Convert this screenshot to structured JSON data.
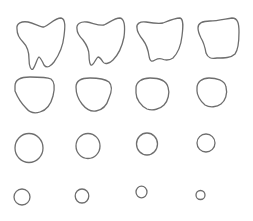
{
  "figure": {
    "background": "#ffffff",
    "stroke_color": "#6e6e6e",
    "stroke_width": 1.3,
    "rows": 4,
    "cols": 4
  },
  "shapes": [
    {
      "row": 1,
      "col": 1,
      "kind": "tooth",
      "stage": 1
    },
    {
      "row": 1,
      "col": 2,
      "kind": "tooth",
      "stage": 2
    },
    {
      "row": 1,
      "col": 3,
      "kind": "tooth",
      "stage": 3
    },
    {
      "row": 1,
      "col": 4,
      "kind": "blob",
      "stage": 4
    },
    {
      "row": 2,
      "col": 1,
      "kind": "rounded-triangle",
      "stage": 5
    },
    {
      "row": 2,
      "col": 2,
      "kind": "rounded-triangle",
      "stage": 6
    },
    {
      "row": 2,
      "col": 3,
      "kind": "rounded-circle",
      "stage": 7
    },
    {
      "row": 2,
      "col": 4,
      "kind": "rounded-circle",
      "stage": 8
    },
    {
      "row": 3,
      "col": 1,
      "kind": "circle",
      "stage": 9,
      "cx": 29,
      "cy": 148,
      "rx": 14,
      "ry": 14.5
    },
    {
      "row": 3,
      "col": 2,
      "kind": "circle",
      "stage": 10,
      "cx": 88,
      "cy": 146,
      "rx": 12,
      "ry": 12.5
    },
    {
      "row": 3,
      "col": 3,
      "kind": "circle",
      "stage": 11,
      "cx": 147,
      "cy": 144,
      "rx": 10.5,
      "ry": 11
    },
    {
      "row": 3,
      "col": 4,
      "kind": "circle",
      "stage": 12,
      "cx": 206,
      "cy": 143,
      "rx": 9,
      "ry": 9
    },
    {
      "row": 4,
      "col": 1,
      "kind": "circle",
      "stage": 13,
      "cx": 22,
      "cy": 197,
      "rx": 8,
      "ry": 8
    },
    {
      "row": 4,
      "col": 2,
      "kind": "circle",
      "stage": 14,
      "cx": 82,
      "cy": 196,
      "rx": 6.8,
      "ry": 7
    },
    {
      "row": 4,
      "col": 3,
      "kind": "circle",
      "stage": 15,
      "cx": 141.5,
      "cy": 192,
      "rx": 5.5,
      "ry": 5.8
    },
    {
      "row": 4,
      "col": 4,
      "kind": "circle",
      "stage": 16,
      "cx": 200.5,
      "cy": 195,
      "rx": 4.5,
      "ry": 4.5
    }
  ]
}
